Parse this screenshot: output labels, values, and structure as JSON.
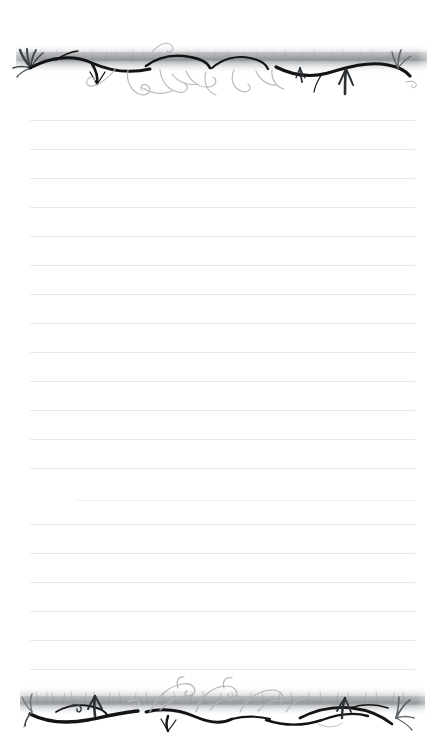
{
  "document": {
    "title": "Lined Stationery Paper",
    "type": "printable-writing-paper",
    "page_width_px": 443,
    "page_height_px": 737,
    "background_color": "#ffffff"
  },
  "borders": {
    "top": {
      "name": "top-decorative-border",
      "motif": "hand-drawn vine, grass tufts and curling tendrils on a horizontal smudged band",
      "ink_color": "#1a1a1a",
      "wash_color": "#b9bcc0",
      "y_px": 38,
      "height_px": 64
    },
    "bottom": {
      "name": "bottom-decorative-border",
      "motif": "hand-drawn vine, grass tufts and curling tendrils on a horizontal smudged band",
      "ink_color": "#1a1a1a",
      "wash_color": "#b9bcc0",
      "y_px": 672,
      "height_px": 62
    }
  },
  "rules": {
    "name": "ruled-writing-lines",
    "color": "#e8e9eb",
    "faint_color": "#f0f1f3",
    "spacing_px": 29,
    "left_px": 30,
    "right_px": 415,
    "count": 20,
    "lines": [
      {
        "y": 120,
        "x1": 30,
        "x2": 415,
        "faint": false
      },
      {
        "y": 149,
        "x1": 30,
        "x2": 415,
        "faint": false
      },
      {
        "y": 178,
        "x1": 30,
        "x2": 415,
        "faint": false
      },
      {
        "y": 207,
        "x1": 30,
        "x2": 415,
        "faint": false
      },
      {
        "y": 236,
        "x1": 30,
        "x2": 415,
        "faint": false
      },
      {
        "y": 265,
        "x1": 30,
        "x2": 415,
        "faint": false
      },
      {
        "y": 294,
        "x1": 30,
        "x2": 415,
        "faint": false
      },
      {
        "y": 323,
        "x1": 30,
        "x2": 415,
        "faint": false
      },
      {
        "y": 352,
        "x1": 30,
        "x2": 415,
        "faint": false
      },
      {
        "y": 381,
        "x1": 30,
        "x2": 415,
        "faint": false
      },
      {
        "y": 410,
        "x1": 30,
        "x2": 415,
        "faint": false
      },
      {
        "y": 439,
        "x1": 30,
        "x2": 415,
        "faint": false
      },
      {
        "y": 468,
        "x1": 30,
        "x2": 415,
        "faint": false
      },
      {
        "y": 500,
        "x1": 75,
        "x2": 415,
        "faint": true
      },
      {
        "y": 524,
        "x1": 30,
        "x2": 415,
        "faint": false
      },
      {
        "y": 553,
        "x1": 30,
        "x2": 415,
        "faint": false
      },
      {
        "y": 582,
        "x1": 30,
        "x2": 415,
        "faint": false
      },
      {
        "y": 611,
        "x1": 30,
        "x2": 415,
        "faint": false
      },
      {
        "y": 640,
        "x1": 30,
        "x2": 415,
        "faint": false
      },
      {
        "y": 669,
        "x1": 30,
        "x2": 415,
        "faint": false
      }
    ]
  }
}
